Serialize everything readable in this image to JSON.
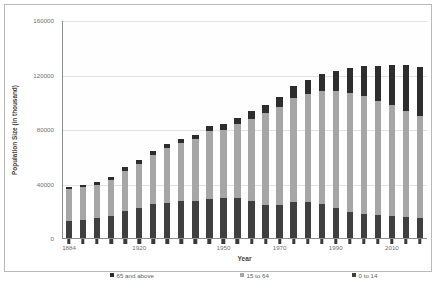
{
  "chart_data": {
    "type": "bar",
    "subtype": "stacked-bar",
    "title": "",
    "xlabel": "Year",
    "ylabel": "Population Size (in thousand)",
    "ylim": [
      0,
      160000
    ],
    "yticks": [
      0,
      40000,
      80000,
      120000,
      160000
    ],
    "ytick_labels": [
      "0",
      "40000",
      "80000",
      "120000",
      "160000"
    ],
    "grid": true,
    "grid_axis": "y",
    "legend_position": "bottom",
    "categories": [
      "1884",
      "1890",
      "1898",
      "1903",
      "1913",
      "1920",
      "1925",
      "1930",
      "1935",
      "1940",
      "1947",
      "1950",
      "1955",
      "1960",
      "1965",
      "1970",
      "1975",
      "1980",
      "1985",
      "1990",
      "1995",
      "2000",
      "2005",
      "2010",
      "2015",
      "2020"
    ],
    "xtick_labels": [
      "1884",
      "1920",
      "1950",
      "1970",
      "1990",
      "2010"
    ],
    "xtick_indices": [
      0,
      5,
      11,
      15,
      19,
      23
    ],
    "series": [
      {
        "name": "0 to 14",
        "color": "#3f3f3f",
        "values": [
          13000,
          14200,
          15500,
          17200,
          20200,
          22800,
          25600,
          26400,
          27800,
          28000,
          29200,
          29800,
          29900,
          28200,
          25200,
          25100,
          27200,
          27500,
          26000,
          22500,
          20000,
          18500,
          17500,
          16800,
          16000,
          15200
        ]
      },
      {
        "name": "15 to 64",
        "color": "#a6a6a6",
        "values": [
          23500,
          24000,
          24400,
          26300,
          29800,
          32600,
          36200,
          40200,
          42600,
          45200,
          49800,
          50200,
          54500,
          60000,
          67000,
          72100,
          76000,
          78800,
          82500,
          86000,
          87200,
          86200,
          84100,
          81700,
          78000,
          75200
        ]
      },
      {
        "name": "65 and above",
        "color": "#2d2d2d",
        "values": [
          1600,
          1800,
          2000,
          2100,
          2600,
          2900,
          3000,
          3100,
          3200,
          3400,
          3700,
          4100,
          4700,
          5400,
          6200,
          7300,
          8800,
          10600,
          12500,
          14900,
          18200,
          22000,
          25700,
          29200,
          33800,
          36200
        ]
      }
    ],
    "legend": [
      "65 and above",
      "15 to 64",
      "0 to 14"
    ]
  },
  "axes": {
    "y_title": "Population Size (in thousand)",
    "x_title": "Year"
  }
}
